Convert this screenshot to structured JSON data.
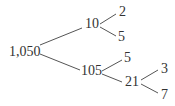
{
  "nodes": {
    "root": "1,050",
    "n10": "10",
    "n2": "2",
    "n5a": "5",
    "n105": "105",
    "n5b": "5",
    "n21": "21",
    "n3": "3",
    "n7": "7"
  },
  "colors": {
    "text": "#333333",
    "line": "#555555"
  }
}
